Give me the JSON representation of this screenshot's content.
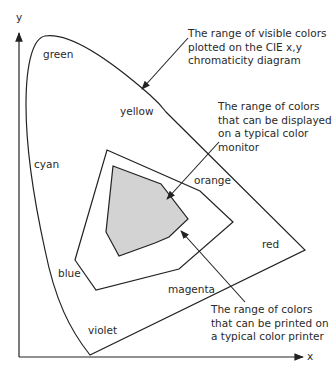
{
  "axes": {
    "x_label": "x",
    "y_label": "y"
  },
  "regions": {
    "visible_gamut": "CIE x,y chromaticity diagram visible colors",
    "monitor_gamut": "typical color monitor",
    "printer_gamut": "typical color printer"
  },
  "color_labels": {
    "green": "green",
    "yellow": "yellow",
    "cyan": "cyan",
    "orange": "orange",
    "red": "red",
    "blue": "blue",
    "magenta": "magenta",
    "violet": "violet"
  },
  "annotations": {
    "visible": [
      "The range of visible colors",
      "plotted on the CIE x,y",
      "chromaticity diagram"
    ],
    "monitor": [
      "The range of colors",
      "that can be displayed",
      "on a typical color",
      "monitor"
    ],
    "printer": [
      "The range of colors",
      "that can be printed on",
      "a typical color printer"
    ]
  },
  "colors": {
    "line": "#222222",
    "printer_fill": "#d3d3d3",
    "background": "#ffffff"
  }
}
